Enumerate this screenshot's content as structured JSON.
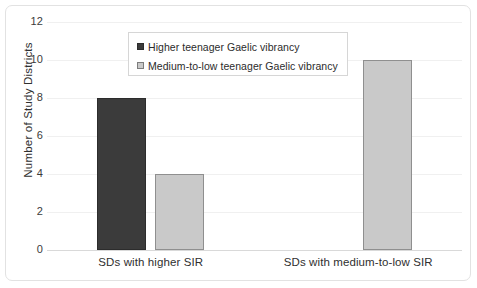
{
  "chart_data": {
    "type": "bar",
    "title": "",
    "xlabel": "",
    "ylabel": "Number of Study Districts",
    "categories": [
      "SDs with higher SIR",
      "SDs with medium-to-low SIR"
    ],
    "series": [
      {
        "name": "Higher teenager Gaelic vibrancy",
        "color": "#3b3b3b",
        "values": [
          8,
          0
        ]
      },
      {
        "name": "Medium-to-low teenager Gaelic vibrancy",
        "color": "#c9c9c9",
        "values": [
          4,
          10
        ]
      }
    ],
    "ylim": [
      0,
      12
    ],
    "yticks": [
      12,
      10,
      8,
      6,
      4,
      2,
      0
    ],
    "ytick_labels": [
      "12",
      "10",
      "8",
      "6",
      "4",
      "2",
      "0"
    ],
    "grid": true,
    "legend_position": "upper-center"
  }
}
